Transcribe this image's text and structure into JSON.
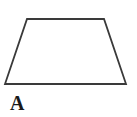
{
  "figure": {
    "type": "geometric-shape-diagram",
    "background_color": "#ffffff",
    "shape": {
      "name": "trapezoid",
      "label": "A",
      "stroke_color": "#3a3a3a",
      "stroke_width": 1.8,
      "fill": "none",
      "vertices": [
        {
          "name": "top-left",
          "x": 27,
          "y": 19
        },
        {
          "name": "top-right",
          "x": 104,
          "y": 19
        },
        {
          "name": "bottom-right",
          "x": 126,
          "y": 84
        },
        {
          "name": "bottom-left",
          "x": 5,
          "y": 84
        }
      ],
      "points_attr": "27,19 104,19 126,84 5,84",
      "edges": [
        {
          "name": "top-edge",
          "from": "top-left",
          "to": "top-right"
        },
        {
          "name": "right-edge",
          "from": "top-right",
          "to": "bottom-right"
        },
        {
          "name": "bottom-edge",
          "from": "bottom-right",
          "to": "bottom-left"
        },
        {
          "name": "left-edge",
          "from": "bottom-left",
          "to": "top-left"
        }
      ]
    },
    "label": {
      "text": "A",
      "color": "#1a1a1a",
      "weight": "bold",
      "style": "serif"
    }
  }
}
